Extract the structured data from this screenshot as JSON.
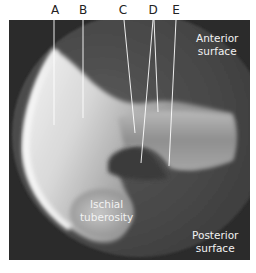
{
  "figure": {
    "type": "radiograph",
    "background_color": "#2b2b2b",
    "bone_color": "#e6e6e6"
  },
  "labels": {
    "letters": [
      {
        "id": "A",
        "text": "A"
      },
      {
        "id": "B",
        "text": "B"
      },
      {
        "id": "C",
        "text": "C"
      },
      {
        "id": "D",
        "text": "D"
      },
      {
        "id": "E",
        "text": "E"
      }
    ],
    "regions": {
      "anterior": {
        "line1": "Anterior",
        "line2": "surface"
      },
      "ischial": {
        "line1": "Ischial",
        "line2": "tuberosity"
      },
      "posterior": {
        "line1": "Posterior",
        "line2": "surface"
      }
    }
  }
}
